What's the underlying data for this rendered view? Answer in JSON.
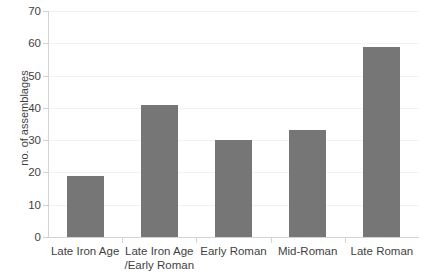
{
  "chart_data": {
    "type": "bar",
    "title": "",
    "xlabel": "",
    "ylabel": "no. of assemblages",
    "categories": [
      "Late Iron Age",
      "Late Iron Age\n/Early Roman",
      "Early Roman",
      "Mid-Roman",
      "Late Roman"
    ],
    "category_lines": [
      [
        "Late Iron Age",
        ""
      ],
      [
        "Late Iron Age",
        "/Early Roman"
      ],
      [
        "Early Roman",
        ""
      ],
      [
        "Mid-Roman",
        ""
      ],
      [
        "Late Roman",
        ""
      ]
    ],
    "values": [
      19,
      41,
      30,
      33,
      59
    ],
    "ylim": [
      0,
      70
    ],
    "ytick_labels": [
      "0",
      "10",
      "20",
      "30",
      "40",
      "50",
      "60",
      "70"
    ],
    "ytick_values": [
      0,
      10,
      20,
      30,
      40,
      50,
      60,
      70
    ],
    "grid": "horizontal",
    "legend": "none",
    "bar_color": "#767676",
    "gridline_color": "#f2f2f2",
    "axis_color": "#d3d3d3",
    "background_color": "#ffffff",
    "text_color": "#3f3f3f"
  }
}
